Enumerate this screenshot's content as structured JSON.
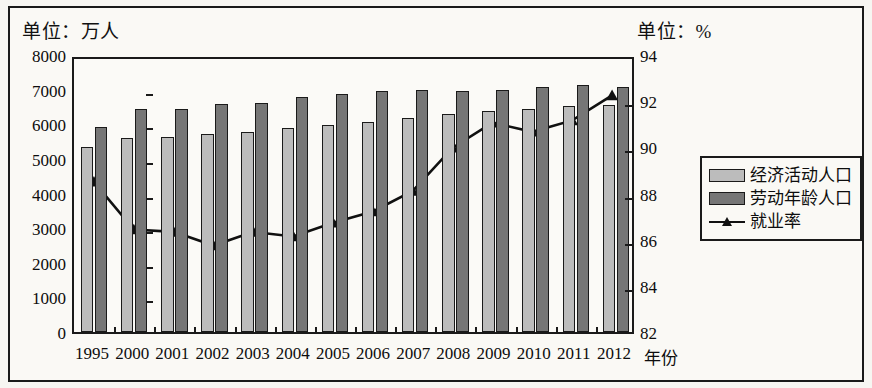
{
  "labels": {
    "unit_left": "单位：万人",
    "unit_right": "单位：%",
    "xaxis_title": "年份"
  },
  "legend": {
    "items": [
      {
        "label": "经济活动人口",
        "type": "bar",
        "color": "#bcbcbc"
      },
      {
        "label": "劳动年龄人口",
        "type": "bar",
        "color": "#767676"
      },
      {
        "label": "就业率",
        "type": "line",
        "color": "#111111"
      }
    ]
  },
  "chart_data": {
    "type": "bar",
    "title": "",
    "subtitle": "",
    "xlabel": "年份",
    "ylabel": "单位：万人",
    "y2label": "单位：%",
    "categories": [
      "1995",
      "2000",
      "2001",
      "2002",
      "2003",
      "2004",
      "2005",
      "2006",
      "2007",
      "2008",
      "2009",
      "2010",
      "2011",
      "2012"
    ],
    "ylim": [
      0,
      8000
    ],
    "yticks": [
      0,
      1000,
      2000,
      3000,
      4000,
      5000,
      6000,
      7000,
      8000
    ],
    "y2lim": [
      82,
      94
    ],
    "y2ticks": [
      82,
      84,
      86,
      88,
      90,
      92,
      94
    ],
    "grid": false,
    "legend_position": "right",
    "series": [
      {
        "name": "经济活动人口",
        "kind": "bar",
        "axis": "left",
        "color": "#bcbcbc",
        "values": [
          5350,
          5600,
          5620,
          5720,
          5780,
          5890,
          5990,
          6060,
          6180,
          6290,
          6380,
          6430,
          6530,
          6570
        ]
      },
      {
        "name": "劳动年龄人口",
        "kind": "bar",
        "axis": "left",
        "color": "#767676",
        "values": [
          5910,
          6430,
          6440,
          6590,
          6620,
          6790,
          6860,
          6960,
          6990,
          6960,
          6990,
          7090,
          7120,
          7090
        ]
      },
      {
        "name": "就业率",
        "kind": "line",
        "axis": "right",
        "color": "#111111",
        "marker": "triangle",
        "values": [
          88.6,
          86.5,
          86.4,
          85.8,
          86.4,
          86.2,
          86.8,
          87.3,
          88.2,
          90.1,
          91.2,
          90.8,
          91.3,
          92.4
        ]
      }
    ]
  }
}
